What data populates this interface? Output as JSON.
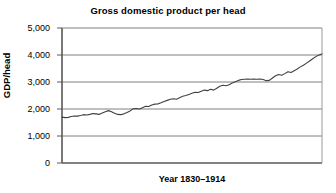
{
  "chart_data": {
    "type": "line",
    "title": "Gross domestic product per head",
    "xlabel": "Year 1830–1914",
    "ylabel": "GDP/head",
    "ylim": [
      0,
      5000
    ],
    "xlim": [
      1830,
      1914
    ],
    "grid": true,
    "legend": "none",
    "ytick_labels": [
      "5,000",
      "4,000",
      "3,000",
      "2,000",
      "1,000",
      "0"
    ],
    "ytick_values": [
      5000,
      4000,
      3000,
      2000,
      1000,
      0
    ],
    "xtick_labels": [],
    "series": [
      {
        "name": "GDP per head",
        "color": "#404040",
        "x": [
          1830,
          1831,
          1832,
          1833,
          1834,
          1835,
          1836,
          1837,
          1838,
          1839,
          1840,
          1841,
          1842,
          1843,
          1844,
          1845,
          1846,
          1847,
          1848,
          1849,
          1850,
          1851,
          1852,
          1853,
          1854,
          1855,
          1856,
          1857,
          1858,
          1859,
          1860,
          1861,
          1862,
          1863,
          1864,
          1865,
          1866,
          1867,
          1868,
          1869,
          1870,
          1871,
          1872,
          1873,
          1874,
          1875,
          1876,
          1877,
          1878,
          1879,
          1880,
          1881,
          1882,
          1883,
          1884,
          1885,
          1886,
          1887,
          1888,
          1889,
          1890,
          1891,
          1892,
          1893,
          1894,
          1895,
          1896,
          1897,
          1898,
          1899,
          1900,
          1901,
          1902,
          1903,
          1904,
          1905,
          1906,
          1907,
          1908,
          1909,
          1910,
          1911,
          1912,
          1913,
          1914
        ],
        "values": [
          1700,
          1680,
          1690,
          1720,
          1740,
          1735,
          1760,
          1790,
          1780,
          1800,
          1830,
          1820,
          1800,
          1850,
          1900,
          1940,
          1900,
          1840,
          1800,
          1790,
          1820,
          1870,
          1930,
          2010,
          2020,
          2000,
          2050,
          2100,
          2090,
          2150,
          2180,
          2190,
          2230,
          2280,
          2320,
          2360,
          2380,
          2360,
          2420,
          2470,
          2500,
          2540,
          2580,
          2620,
          2610,
          2660,
          2700,
          2680,
          2730,
          2700,
          2770,
          2840,
          2880,
          2860,
          2900,
          2960,
          3010,
          3060,
          3090,
          3100,
          3110,
          3100,
          3110,
          3100,
          3110,
          3090,
          3050,
          3060,
          3150,
          3230,
          3280,
          3250,
          3310,
          3380,
          3350,
          3420,
          3480,
          3560,
          3620,
          3700,
          3780,
          3860,
          3940,
          4000,
          4040
        ]
      }
    ]
  },
  "axes": {
    "title": "Gross domestic product per head",
    "y_title": "GDP/head",
    "x_title": "Year 1830–1914",
    "y_labels": [
      "5,000",
      "4,000",
      "3,000",
      "2,000",
      "1,000",
      "0"
    ]
  },
  "colors": {
    "line": "#404040",
    "grid": "#808080",
    "axis": "#595959",
    "background": "#ffffff",
    "text": "#000000"
  }
}
